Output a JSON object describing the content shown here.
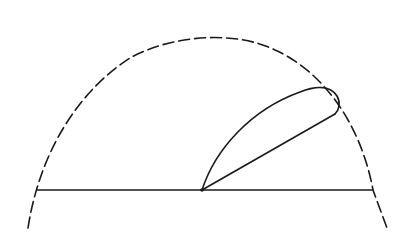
{
  "diagram": {
    "type": "polar radiation pattern sketch",
    "colors": {
      "background": "#ffffff",
      "stroke": "#1a1a1a"
    },
    "origin": [
      202,
      190
    ],
    "baseline": {
      "x1": 37,
      "y1": 190,
      "x2": 373,
      "y2": 190
    },
    "envelope": {
      "style": "dashed",
      "path": "M 28 228 C 40 150, 80 90, 130 58 C 165 38, 230 28, 275 50 C 320 70, 360 120, 373 190 L 387 228"
    },
    "radius_line": {
      "x1": 202,
      "y1": 190,
      "x2": 335,
      "y2": 114
    },
    "lobe": {
      "style": "solid",
      "path": "M 202 190 C 215 150, 250 110, 300 92 C 315 86, 330 85, 337 96 C 341 103, 339 110, 335 114"
    }
  }
}
